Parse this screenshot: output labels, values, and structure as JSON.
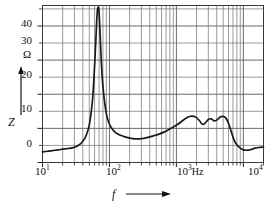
{
  "chart_data": {
    "type": "line",
    "title": "",
    "xlabel": "f",
    "ylabel": "Z",
    "yunit": "Ω",
    "xunit": "Hz",
    "xscale": "log",
    "yscale": "linear",
    "xlim": [
      10,
      20000
    ],
    "ylim": [
      0,
      46
    ],
    "grid": true,
    "grid_minor": true,
    "legend": "none",
    "ytick_labels": [
      "0",
      "10",
      "20",
      "30",
      "40"
    ],
    "ytick_values": [
      0,
      10,
      20,
      30,
      40
    ],
    "yminor_step": 5,
    "xtick_labels": [
      "10",
      "10",
      "10",
      "10"
    ],
    "xtick_exponents": [
      "1",
      "2",
      "3",
      "4"
    ],
    "xtick_values": [
      10,
      100,
      1000,
      10000
    ],
    "series": [
      {
        "name": "Impedance",
        "color": "#1a1a1a",
        "x": [
          10,
          12,
          14,
          17,
          20,
          24,
          28,
          32,
          36,
          40,
          45,
          50,
          55,
          58,
          61,
          64,
          66,
          68,
          70,
          72,
          75,
          78,
          82,
          87,
          93,
          100,
          110,
          120,
          135,
          150,
          170,
          195,
          225,
          260,
          300,
          350,
          400,
          470,
          550,
          650,
          760,
          900,
          1050,
          1250,
          1450,
          1700,
          1950,
          2200,
          2450,
          2700,
          3000,
          3300,
          3700,
          4100,
          4500,
          5000,
          5500,
          6000,
          6600,
          7200,
          8000,
          9000,
          10000,
          11500,
          13000,
          15000,
          17000,
          20000
        ],
        "y": [
          3.1,
          3.3,
          3.5,
          3.7,
          3.9,
          4.1,
          4.3,
          4.7,
          5.3,
          6.2,
          8.0,
          11.0,
          17.0,
          23.0,
          31.0,
          40.0,
          44.5,
          45.5,
          44.0,
          39.0,
          31.0,
          25.0,
          20.0,
          16.0,
          13.0,
          11.2,
          9.8,
          9.0,
          8.3,
          7.9,
          7.5,
          7.2,
          7.0,
          6.95,
          7.0,
          7.2,
          7.5,
          7.9,
          8.3,
          8.9,
          9.6,
          10.4,
          11.2,
          12.3,
          13.2,
          13.6,
          13.3,
          12.3,
          11.2,
          11.6,
          12.6,
          12.8,
          12.2,
          12.6,
          13.3,
          13.5,
          13.0,
          11.5,
          9.0,
          6.8,
          5.2,
          4.2,
          3.7,
          3.6,
          3.8,
          4.2,
          4.4,
          4.5
        ]
      }
    ],
    "annotations": {
      "resonance_peak_hz": 68,
      "resonance_peak_ohm": 45.5,
      "minimum_hz": 260,
      "minimum_ohm": 6.95
    }
  },
  "axes": {
    "y_axis_arrow_label": "Z",
    "y_axis_unit": "Ω",
    "x_axis_arrow_label": "f",
    "x_axis_unit": "Hz"
  }
}
